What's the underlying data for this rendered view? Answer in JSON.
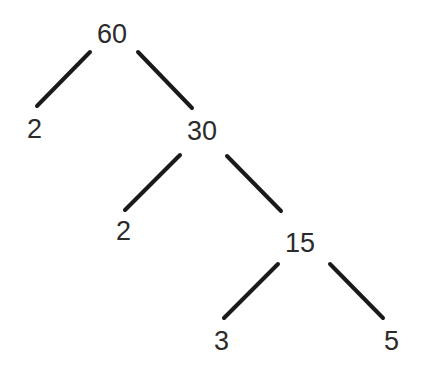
{
  "diagram": {
    "type": "factor-tree",
    "stroke_color": "#1a1a1a",
    "text_color": "#2b2b2b",
    "nodes": [
      {
        "id": "n60",
        "label": "60",
        "x": 97,
        "y": 21
      },
      {
        "id": "n2a",
        "label": "2",
        "x": 27,
        "y": 116
      },
      {
        "id": "n30",
        "label": "30",
        "x": 187,
        "y": 118
      },
      {
        "id": "n2b",
        "label": "2",
        "x": 116,
        "y": 218
      },
      {
        "id": "n15",
        "label": "15",
        "x": 285,
        "y": 230
      },
      {
        "id": "n3",
        "label": "3",
        "x": 214,
        "y": 328
      },
      {
        "id": "n5",
        "label": "5",
        "x": 384,
        "y": 328
      }
    ],
    "edges": [
      {
        "from": "60",
        "to": "2",
        "x1": 90,
        "y1": 52,
        "x2": 37,
        "y2": 106
      },
      {
        "from": "60",
        "to": "30",
        "x1": 138,
        "y1": 52,
        "x2": 192,
        "y2": 108
      },
      {
        "from": "30",
        "to": "2",
        "x1": 180,
        "y1": 155,
        "x2": 125,
        "y2": 210
      },
      {
        "from": "30",
        "to": "15",
        "x1": 227,
        "y1": 156,
        "x2": 281,
        "y2": 211
      },
      {
        "from": "15",
        "to": "3",
        "x1": 278,
        "y1": 264,
        "x2": 224,
        "y2": 318
      },
      {
        "from": "15",
        "to": "5",
        "x1": 330,
        "y1": 264,
        "x2": 383,
        "y2": 318
      }
    ]
  }
}
